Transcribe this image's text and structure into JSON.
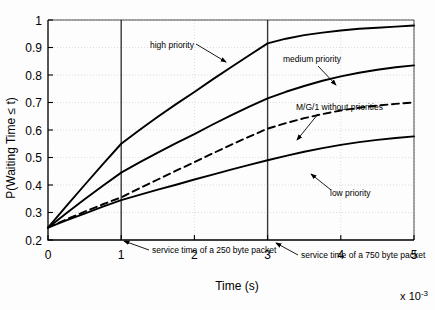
{
  "chart_data": {
    "type": "line",
    "title": "",
    "xlabel": "Time (s)",
    "ylabel": "P(Waiting Time ≤ t)",
    "x_multiplier": "x 10",
    "x_multiplier_exp": "-3",
    "xlim": [
      0,
      5
    ],
    "ylim": [
      0.2,
      1
    ],
    "xticks": [
      "0",
      "1",
      "2",
      "3",
      "4",
      "5"
    ],
    "xtick_values": [
      0,
      1,
      2,
      3,
      4,
      5
    ],
    "yticks": [
      "0.2",
      "0.3",
      "0.4",
      "0.5",
      "0.6",
      "0.7",
      "0.8",
      "0.9",
      "1"
    ],
    "ytick_values": [
      0.2,
      0.3,
      0.4,
      0.5,
      0.6,
      0.7,
      0.8,
      0.9,
      1.0
    ],
    "grid": true,
    "legend_position": "inline-annotations",
    "x": [
      0,
      0.25,
      0.5,
      0.75,
      1,
      1.25,
      1.5,
      1.75,
      2,
      2.25,
      2.5,
      2.75,
      3,
      3.25,
      3.5,
      3.75,
      4,
      4.25,
      4.5,
      4.75,
      5
    ],
    "series": [
      {
        "name": "high priority",
        "style": "solid",
        "color": "#000000",
        "values": [
          0.245,
          0.323,
          0.4,
          0.476,
          0.55,
          0.6,
          0.648,
          0.694,
          0.738,
          0.784,
          0.828,
          0.872,
          0.915,
          0.932,
          0.945,
          0.954,
          0.962,
          0.968,
          0.972,
          0.976,
          0.98
        ]
      },
      {
        "name": "medium priority",
        "style": "solid",
        "color": "#000000",
        "values": [
          0.245,
          0.297,
          0.348,
          0.397,
          0.445,
          0.482,
          0.518,
          0.552,
          0.585,
          0.62,
          0.653,
          0.685,
          0.715,
          0.739,
          0.76,
          0.779,
          0.795,
          0.808,
          0.819,
          0.828,
          0.835
        ]
      },
      {
        "name": "M/G/1 without priorities",
        "style": "dashed",
        "color": "#000000",
        "values": [
          0.245,
          0.275,
          0.303,
          0.33,
          0.355,
          0.388,
          0.42,
          0.452,
          0.483,
          0.515,
          0.546,
          0.576,
          0.605,
          0.625,
          0.643,
          0.658,
          0.671,
          0.681,
          0.689,
          0.695,
          0.7
        ]
      },
      {
        "name": "low priority",
        "style": "solid",
        "color": "#000000",
        "values": [
          0.245,
          0.271,
          0.296,
          0.321,
          0.345,
          0.364,
          0.383,
          0.401,
          0.42,
          0.438,
          0.456,
          0.473,
          0.49,
          0.506,
          0.521,
          0.534,
          0.546,
          0.556,
          0.564,
          0.571,
          0.577
        ]
      }
    ],
    "vlines": [
      {
        "x": 1,
        "label": "service time of a 250 byte packet"
      },
      {
        "x": 3,
        "label": "service time of a 750 byte packet"
      }
    ],
    "annotations": [
      {
        "name": "high-priority",
        "text": "high priority",
        "text_x": 150,
        "text_y": 48,
        "arrow_from_x": 196,
        "arrow_from_y": 44,
        "arrow_to_x": 226,
        "arrow_to_y": 62
      },
      {
        "name": "medium-priority",
        "text": "medium priority",
        "text_x": 283,
        "text_y": 62,
        "arrow_from_x": 318,
        "arrow_from_y": 66,
        "arrow_to_x": 336,
        "arrow_to_y": 85
      },
      {
        "name": "mg1-without-priorities",
        "text": "M/G/1 without priorities",
        "text_x": 296,
        "text_y": 110,
        "arrow_from_x": 318,
        "arrow_from_y": 114,
        "arrow_to_x": 297,
        "arrow_to_y": 140
      },
      {
        "name": "low-priority",
        "text": "low priority",
        "text_x": 330,
        "text_y": 196,
        "arrow_from_x": 331,
        "arrow_from_y": 190,
        "arrow_to_x": 311,
        "arrow_to_y": 174
      },
      {
        "name": "vline-250",
        "text": "service time of a 250 byte packet",
        "text_x": 152,
        "text_y": 253,
        "arrow_from_x": 149,
        "arrow_from_y": 250,
        "arrow_to_x": 124,
        "arrow_to_y": 241
      },
      {
        "name": "vline-750",
        "text": "service time of a 750 byte packet",
        "text_x": 301,
        "text_y": 258,
        "arrow_from_x": 298,
        "arrow_from_y": 255,
        "arrow_to_x": 276,
        "arrow_to_y": 243
      }
    ]
  }
}
